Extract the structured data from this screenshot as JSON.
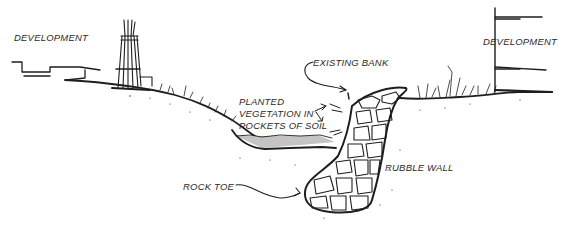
{
  "diagram": {
    "type": "cross-section sketch",
    "colors": {
      "ink": "#1e1e1e",
      "water": "#c4c4c4",
      "background": "#ffffff"
    },
    "labels": {
      "development_left": "DEVELOPMENT",
      "development_right": "DEVELOPMENT",
      "existing_bank": "EXISTING BANK",
      "planted_vegetation": [
        "PLANTED",
        "VEGETATION IN",
        "POCKETS OF SOIL"
      ],
      "rubble_wall": "RUBBLE WALL",
      "rock_toe": "ROCK TOE"
    }
  }
}
